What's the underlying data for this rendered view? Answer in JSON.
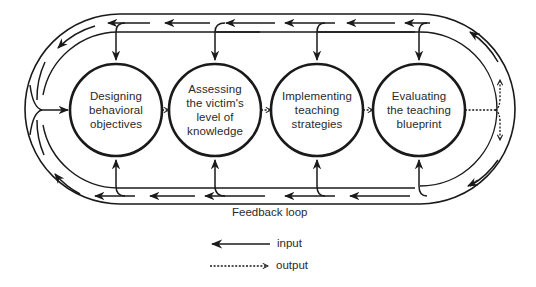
{
  "diagram": {
    "type": "process-cycle",
    "nodes": [
      {
        "id": "n1",
        "label_lines": [
          "Designing",
          "behavioral",
          "objectives"
        ]
      },
      {
        "id": "n2",
        "label_lines": [
          "Assessing",
          "the victim's",
          "level of",
          "knowledge"
        ]
      },
      {
        "id": "n3",
        "label_lines": [
          "Implementing",
          "teaching",
          "strategies"
        ]
      },
      {
        "id": "n4",
        "label_lines": [
          "Evaluating",
          "the teaching",
          "blueprint"
        ]
      }
    ],
    "edges": [
      {
        "from": "n1",
        "to": "n2",
        "kind": "output"
      },
      {
        "from": "n2",
        "to": "n3",
        "kind": "output"
      },
      {
        "from": "n3",
        "to": "n4",
        "kind": "output"
      },
      {
        "from": "n4",
        "to": "feedback-loop",
        "kind": "output"
      },
      {
        "from": "feedback-loop",
        "to": "n1",
        "kind": "input"
      },
      {
        "from": "feedback-loop",
        "to": "n2",
        "kind": "input"
      },
      {
        "from": "feedback-loop",
        "to": "n3",
        "kind": "input"
      },
      {
        "from": "feedback-loop",
        "to": "n4",
        "kind": "input"
      }
    ],
    "loop_label": "Feedback loop",
    "legend": [
      {
        "symbol": "solid-arrow-left",
        "label": "input"
      },
      {
        "symbol": "dashed-arrow-right",
        "label": "output"
      }
    ],
    "colors": {
      "line": "#1a1a1a",
      "background": "#ffffff",
      "text": "#2a2a2a"
    }
  }
}
